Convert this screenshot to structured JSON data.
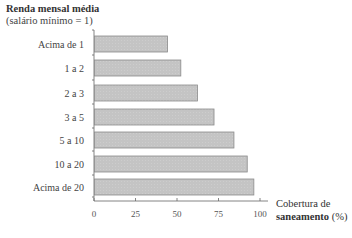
{
  "chart_data": {
    "type": "bar",
    "orientation": "horizontal",
    "title": "",
    "ylabel": "Renda mensal média (salário mínimo = 1)",
    "ylabel_line1": "Renda mensal média",
    "ylabel_line2": "(salário mínimo = 1)",
    "xlabel": "Cobertura de saneamento (%)",
    "xlabel_line1": "Cobertura de",
    "xlabel_line2_bold": "saneamento",
    "xlabel_line2_unit": " (%)",
    "categories": [
      "Acima de 1",
      "1 a 2",
      "2 a 3",
      "3 a 5",
      "5 a 10",
      "10 a 20",
      "Acima de 20"
    ],
    "values": [
      44,
      52,
      62,
      72,
      84,
      92,
      96
    ],
    "xlim": [
      0,
      100
    ],
    "xticks": [
      0,
      25,
      50,
      75,
      100
    ],
    "xtick_labels": [
      "0",
      "25",
      "50",
      "75",
      "100"
    ],
    "grid": false,
    "legend": null,
    "colors": {
      "bar_fill": "#c4c4c4",
      "bar_stroke": "#8a8a8a",
      "axis": "#666666"
    }
  }
}
